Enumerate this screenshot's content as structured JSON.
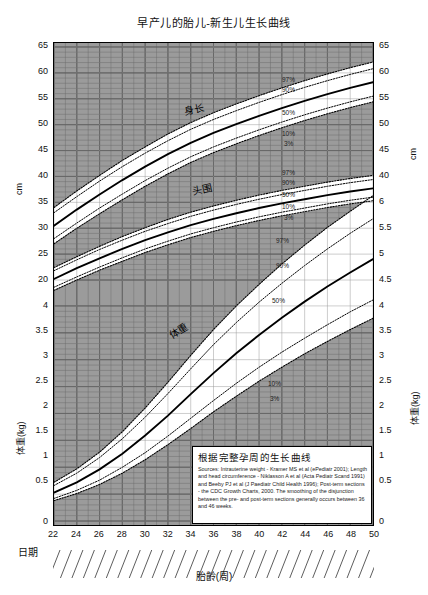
{
  "title": "早产儿的胎儿-新生儿生长曲线",
  "axes": {
    "left_upper_unit": "cm",
    "left_lower_unit": "体重(kg)",
    "right_upper_unit": "cm",
    "right_lower_unit": "体重(kg)",
    "x_label": "胎齡(周)",
    "date_label": "日期",
    "left_ticks": [
      "65",
      "60",
      "55",
      "50",
      "45",
      "40",
      "35",
      "30",
      "25",
      "20",
      "4",
      "3.5",
      "3",
      "2.5",
      "2",
      "1.5",
      "1",
      "0.5",
      "0"
    ],
    "right_ticks": [
      "65",
      "60",
      "55",
      "50",
      "45",
      "40",
      "6",
      "5.5",
      "5",
      "4.5",
      "4",
      "3.5",
      "3",
      "2.5",
      "2",
      "1.5",
      "1",
      "0.5",
      "0"
    ],
    "x_ticks": [
      "22",
      "24",
      "26",
      "28",
      "30",
      "32",
      "34",
      "36",
      "38",
      "40",
      "42",
      "44",
      "46",
      "48",
      "50"
    ]
  },
  "curve_names": {
    "length": "身长",
    "head": "头围",
    "weight": "体重"
  },
  "percentiles": [
    "97%",
    "90%",
    "50%",
    "10%",
    "3%"
  ],
  "source_box": {
    "title": "根据完整孕周的生长曲线",
    "body": "Sources: Intrauterine weight - Kramer MS et al (ePediatr 2001); Length and head circumference - Niklasson A et al (Acta Pediatr Scand 1991) and Beeby PJ et al (J Paediatr Child Health 1996); Post-term sections - the CDC Growth Charts, 2000. The smoothing of the disjunction between the pre- and post-term sections generally occurs between 36 and 46 weeks."
  },
  "colors": {
    "grid_shade": "#9a9a9a",
    "grid_line": "#555555",
    "curve": "#000000",
    "frame": "#000000"
  },
  "chart_data": {
    "type": "line",
    "title": "早产儿的胎儿-新生儿生长曲线",
    "xlabel": "胎齡(周)",
    "ylabel": "cm / 体重(kg)",
    "xlim": [
      22,
      50
    ],
    "grid": true,
    "legend": "inline-labels",
    "x": [
      22,
      24,
      26,
      28,
      30,
      32,
      34,
      36,
      38,
      40,
      42,
      44,
      46,
      48,
      50
    ],
    "panels": [
      {
        "name": "身长",
        "unit": "cm",
        "ylim_left": [
          20,
          65
        ],
        "ylim_right": [
          40,
          65
        ],
        "series": [
          {
            "name": "97%",
            "values": [
              34.0,
              37.2,
              40.2,
              43.1,
              45.7,
              48.2,
              50.4,
              52.3,
              54.0,
              55.6,
              57.1,
              58.5,
              59.8,
              61.0,
              62.1
            ]
          },
          {
            "name": "90%",
            "values": [
              33.0,
              36.1,
              39.1,
              41.9,
              44.5,
              46.9,
              49.1,
              51.0,
              52.7,
              54.3,
              55.8,
              57.2,
              58.5,
              59.7,
              60.8
            ]
          },
          {
            "name": "50%",
            "values": [
              30.5,
              33.6,
              36.5,
              39.3,
              41.9,
              44.3,
              46.5,
              48.4,
              50.1,
              51.7,
              53.2,
              54.6,
              55.9,
              57.1,
              58.2
            ]
          },
          {
            "name": "10%",
            "values": [
              28.0,
              31.0,
              33.9,
              36.6,
              39.2,
              41.6,
              43.8,
              45.7,
              47.4,
              49.0,
              50.5,
              51.9,
              53.2,
              54.4,
              55.5
            ]
          },
          {
            "name": "3%",
            "values": [
              27.0,
              30.0,
              32.8,
              35.5,
              38.1,
              40.5,
              42.7,
              44.6,
              46.3,
              47.9,
              49.4,
              50.8,
              52.1,
              53.3,
              54.4
            ]
          }
        ]
      },
      {
        "name": "头围",
        "unit": "cm",
        "ylim_left": [
          20,
          65
        ],
        "ylim_right": [
          40,
          65
        ],
        "series": [
          {
            "name": "97%",
            "values": [
              22.4,
              24.5,
              26.5,
              28.4,
              30.1,
              31.7,
              33.1,
              34.3,
              35.4,
              36.4,
              37.3,
              38.1,
              38.9,
              39.6,
              40.2
            ]
          },
          {
            "name": "90%",
            "values": [
              21.8,
              23.9,
              25.9,
              27.7,
              29.4,
              30.9,
              32.3,
              33.5,
              34.6,
              35.6,
              36.5,
              37.3,
              38.1,
              38.8,
              39.4
            ]
          },
          {
            "name": "50%",
            "values": [
              20.2,
              22.3,
              24.2,
              26.0,
              27.7,
              29.2,
              30.6,
              31.8,
              32.9,
              33.9,
              34.8,
              35.6,
              36.4,
              37.1,
              37.7
            ]
          },
          {
            "name": "10%",
            "values": [
              18.6,
              20.6,
              22.5,
              24.3,
              26.0,
              27.5,
              28.9,
              30.1,
              31.2,
              32.2,
              33.1,
              33.9,
              34.7,
              35.4,
              36.0
            ]
          },
          {
            "name": "3%",
            "values": [
              18.0,
              20.0,
              21.9,
              23.6,
              25.3,
              26.8,
              28.2,
              29.4,
              30.5,
              31.5,
              32.4,
              33.2,
              34.0,
              34.7,
              35.3
            ]
          }
        ]
      },
      {
        "name": "体重",
        "unit": "kg",
        "ylim_left": [
          0,
          4
        ],
        "ylim_right": [
          0,
          6
        ],
        "series": [
          {
            "name": "97%",
            "values": [
              0.72,
              0.97,
              1.28,
              1.66,
              2.1,
              2.58,
              3.08,
              3.56,
              4.0,
              4.4,
              4.78,
              5.13,
              5.46,
              5.76,
              6.05
            ]
          },
          {
            "name": "90%",
            "values": [
              0.66,
              0.89,
              1.18,
              1.53,
              1.93,
              2.37,
              2.83,
              3.28,
              3.69,
              4.07,
              4.42,
              4.75,
              5.06,
              5.35,
              5.62
            ]
          },
          {
            "name": "50%",
            "values": [
              0.53,
              0.72,
              0.96,
              1.25,
              1.59,
              1.96,
              2.36,
              2.75,
              3.12,
              3.46,
              3.78,
              4.08,
              4.36,
              4.62,
              4.87
            ]
          },
          {
            "name": "10%",
            "values": [
              0.42,
              0.57,
              0.76,
              1.0,
              1.27,
              1.58,
              1.91,
              2.24,
              2.56,
              2.86,
              3.14,
              3.4,
              3.65,
              3.89,
              4.11
            ]
          },
          {
            "name": "3%",
            "values": [
              0.38,
              0.51,
              0.68,
              0.89,
              1.14,
              1.42,
              1.72,
              2.03,
              2.32,
              2.6,
              2.86,
              3.11,
              3.34,
              3.56,
              3.77
            ]
          }
        ]
      }
    ]
  }
}
